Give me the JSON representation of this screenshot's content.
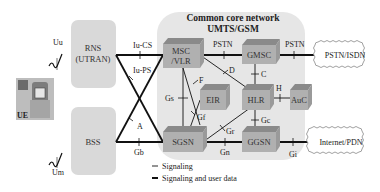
{
  "title": {
    "line1": "Common core network",
    "line2": "UMTS/GSM"
  },
  "access": {
    "rns": {
      "line1": "RNS",
      "line2": "(UTRAN)"
    },
    "bss": {
      "label": "BSS"
    },
    "ue": {
      "label": "UE"
    }
  },
  "nodes": {
    "msc": {
      "line1": "MSC",
      "line2": "/VLR"
    },
    "gmsc": {
      "label": "GMSC"
    },
    "eir": {
      "label": "EIR"
    },
    "hlr": {
      "label": "HLR"
    },
    "auc": {
      "label": "AuC"
    },
    "sgsn": {
      "label": "SGSN"
    },
    "ggsn": {
      "label": "GGSN"
    }
  },
  "clouds": {
    "pstn_isdn": "PSTN/ISDN",
    "internet_pdn": "Internet/PDN"
  },
  "interfaces": {
    "uu": "Uu",
    "um": "Um",
    "iu_cs": "Iu-CS",
    "iu_ps": "Iu-PS",
    "a": "A",
    "gb": "Gb",
    "pstn1": "PSTN",
    "pstn2": "PSTN",
    "d": "D",
    "c": "C",
    "f": "F",
    "gs": "Gs",
    "gf": "Gf",
    "h": "H",
    "gr": "Gr",
    "gc": "Gc",
    "gn": "Gn",
    "gi": "Gi"
  },
  "legend": {
    "signaling": "Signaling",
    "signaling_user_data": "Signaling and user data"
  },
  "colors": {
    "core_bg": "#e6e6e6",
    "access_box": "#d9d9d9",
    "node_front": "#a8a8a8",
    "node_top": "#8a8a8a",
    "line": "#111111"
  }
}
